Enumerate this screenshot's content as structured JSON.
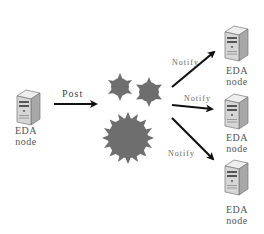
{
  "diagram": {
    "title": "",
    "colors": {
      "background": "#ffffff",
      "arrow": "#111111",
      "hub": "#6e6e6e",
      "text": "#555555",
      "server_body": "#d9d9d9",
      "server_dark": "#7a7a7a"
    },
    "nodes": [
      {
        "id": "source",
        "icon": "server-icon",
        "line1": "EDA",
        "line2": "node"
      },
      {
        "id": "target-1",
        "icon": "server-icon",
        "line1": "EDA",
        "line2": "node"
      },
      {
        "id": "target-2",
        "icon": "server-icon",
        "line1": "EDA",
        "line2": "node"
      },
      {
        "id": "target-3",
        "icon": "server-icon",
        "line1": "EDA",
        "line2": "node"
      }
    ],
    "hub": {
      "icon": "virus-cluster-icon",
      "shapes": 3
    },
    "edges": [
      {
        "from": "source",
        "to": "hub",
        "label": "Post"
      },
      {
        "from": "hub",
        "to": "target-1",
        "label": "Notify"
      },
      {
        "from": "hub",
        "to": "target-2",
        "label": "Notify"
      },
      {
        "from": "hub",
        "to": "target-3",
        "label": "Notify"
      }
    ]
  }
}
